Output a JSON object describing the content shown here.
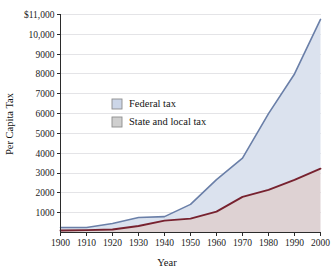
{
  "chart_data": {
    "type": "area",
    "title": "",
    "xlabel": "Year",
    "ylabel": "Per Capita Tax",
    "x": [
      1900,
      1910,
      1920,
      1930,
      1940,
      1950,
      1960,
      1970,
      1980,
      1990,
      2000
    ],
    "xlim": [
      1900,
      2000
    ],
    "ylim": [
      0,
      11000
    ],
    "grid": true,
    "stacked": true,
    "legend_position": "inside-upper-left",
    "x_tick_labels": [
      "1900",
      "1910",
      "1920",
      "1930",
      "1940",
      "1950",
      "1960",
      "1970",
      "1980",
      "1990",
      "2000"
    ],
    "y_tick_labels": [
      "1000",
      "2000",
      "3000",
      "4000",
      "5000",
      "6000",
      "7000",
      "8000",
      "9000",
      "10,000",
      "$11,000"
    ],
    "y_tick_values": [
      1000,
      2000,
      3000,
      4000,
      5000,
      6000,
      7000,
      8000,
      9000,
      10000,
      11000
    ],
    "series": [
      {
        "name": "Federal tax",
        "key": "federal",
        "line_color": "#6a7fa8",
        "fill_color": "#dbe2ee",
        "swatch_color": "#ccd6e8",
        "values": [
          250,
          250,
          450,
          760,
          800,
          1420,
          2670,
          3750,
          6000,
          8000,
          10750
        ]
      },
      {
        "name": "State and local tax",
        "key": "state_local",
        "line_color": "#77222f",
        "fill_color": "#ded2d3",
        "swatch_color": "#cfcfcf",
        "values": [
          100,
          120,
          150,
          330,
          600,
          700,
          1050,
          1800,
          2150,
          2650,
          3220
        ]
      }
    ]
  },
  "axes": {
    "y_title": "Per Capita Tax",
    "x_title": "Year"
  },
  "legend": {
    "items": [
      {
        "label": "Federal tax"
      },
      {
        "label": "State and local tax"
      }
    ]
  },
  "colors": {
    "federal_line": "#6a7fa8",
    "federal_fill": "#dbe2ee",
    "state_line": "#77222f",
    "state_fill": "#ded2d3",
    "axis": "#2b2b2b",
    "grid": "#d8d8dd",
    "text": "#141414",
    "background": "#ffffff"
  }
}
